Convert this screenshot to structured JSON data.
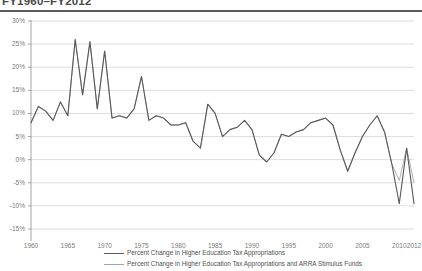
{
  "title": "FY1960–FY2012",
  "legend": {
    "items": [
      {
        "label": "Percent Change in Higher Education Tax Appropriations",
        "color": "#595959",
        "width": 1.5
      },
      {
        "label": "Percent Change in Higher Education Tax Appropriations and ARRA Stimulus Funds",
        "color": "#a6a6a6",
        "width": 1.0
      }
    ]
  },
  "chart_data": {
    "type": "line",
    "title": "FY1960–FY2012",
    "xlabel": "",
    "ylabel": "",
    "xlim": [
      1960,
      2012
    ],
    "ylim": [
      -15,
      30
    ],
    "grid": true,
    "legend_position": "bottom",
    "ytick_labels": [
      "30%",
      "25%",
      "20%",
      "15%",
      "10%",
      "5%",
      "0%",
      "-5%",
      "-10%",
      "-15%"
    ],
    "ytick_values": [
      30,
      25,
      20,
      15,
      10,
      5,
      0,
      -5,
      -10,
      -15
    ],
    "xtick_labels": [
      "1960",
      "1965",
      "1970",
      "1975",
      "1980",
      "1985",
      "1990",
      "1995",
      "2000",
      "2005",
      "2010",
      "2012"
    ],
    "xtick_values": [
      1960,
      1965,
      1970,
      1975,
      1980,
      1985,
      1990,
      1995,
      2000,
      2005,
      2010,
      2012
    ],
    "x": [
      1960,
      1961,
      1962,
      1963,
      1964,
      1965,
      1966,
      1967,
      1968,
      1969,
      1970,
      1971,
      1972,
      1973,
      1974,
      1975,
      1976,
      1977,
      1978,
      1979,
      1980,
      1981,
      1982,
      1983,
      1984,
      1985,
      1986,
      1987,
      1988,
      1989,
      1990,
      1991,
      1992,
      1993,
      1994,
      1995,
      1996,
      1997,
      1998,
      1999,
      2000,
      2001,
      2002,
      2003,
      2004,
      2005,
      2006,
      2007,
      2008,
      2009,
      2010,
      2011,
      2012
    ],
    "series": [
      {
        "name": "Percent Change in Higher Education Tax Appropriations",
        "color": "#595959",
        "values": [
          8.0,
          11.5,
          10.5,
          8.5,
          12.5,
          9.5,
          26.0,
          14.0,
          25.5,
          11.0,
          23.5,
          9.0,
          9.5,
          9.0,
          11.0,
          18.0,
          8.5,
          9.5,
          9.0,
          7.5,
          7.5,
          8.0,
          4.0,
          2.5,
          12.0,
          10.0,
          5.0,
          6.5,
          7.0,
          8.5,
          6.5,
          1.0,
          -0.5,
          1.5,
          5.5,
          5.0,
          6.0,
          6.5,
          8.0,
          8.5,
          9.0,
          7.5,
          2.0,
          -2.5,
          1.5,
          5.0,
          7.5,
          9.5,
          6.0,
          -1.0,
          -9.5,
          2.5,
          -9.5
        ]
      },
      {
        "name": "Percent Change in Higher Education Tax Appropriations and ARRA Stimulus Funds",
        "color": "#a6a6a6",
        "values": [
          8.0,
          11.5,
          10.5,
          8.5,
          12.5,
          9.5,
          26.0,
          14.0,
          25.5,
          11.0,
          23.5,
          9.0,
          9.5,
          9.0,
          11.0,
          18.0,
          8.5,
          9.5,
          9.0,
          7.5,
          7.5,
          8.0,
          4.0,
          2.5,
          12.0,
          10.0,
          5.0,
          6.5,
          7.0,
          8.5,
          6.5,
          1.0,
          -0.5,
          1.5,
          5.5,
          5.0,
          6.0,
          6.5,
          8.0,
          8.5,
          9.0,
          7.5,
          2.0,
          -2.5,
          1.5,
          5.0,
          7.5,
          9.5,
          6.0,
          -1.0,
          -4.5,
          2.5,
          -5.0
        ]
      }
    ]
  }
}
